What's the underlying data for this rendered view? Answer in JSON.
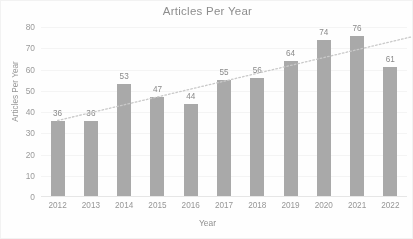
{
  "chart_data": {
    "type": "bar",
    "title": "Articles Per Year",
    "xlabel": "Year",
    "ylabel": "Articles Per Year",
    "categories": [
      "2012",
      "2013",
      "2014",
      "2015",
      "2016",
      "2017",
      "2018",
      "2019",
      "2020",
      "2021",
      "2022"
    ],
    "values": [
      36,
      36,
      53,
      47,
      44,
      55,
      56,
      64,
      74,
      76,
      61
    ],
    "ylim": [
      0,
      80
    ],
    "yticks": [
      0,
      10,
      20,
      30,
      40,
      50,
      60,
      70,
      80
    ],
    "ytick_labels": [
      "0",
      "10",
      "20",
      "30",
      "40",
      "50",
      "60",
      "70",
      "80"
    ],
    "grid": true,
    "legend": false,
    "data_labels": true,
    "bar_color": "#a9a9a9",
    "trendline": {
      "present": true,
      "style": "dotted",
      "color": "#c9c9c9",
      "start_value": 36,
      "end_value": 73
    }
  }
}
